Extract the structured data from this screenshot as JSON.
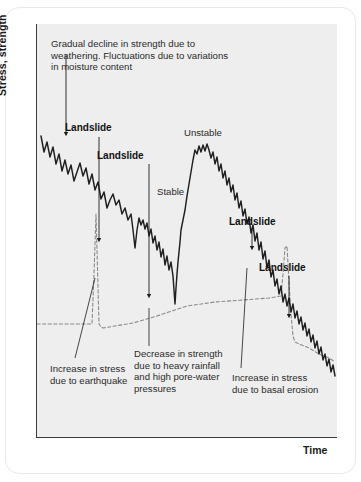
{
  "figure": {
    "axes": {
      "y_label": "Stress, strength",
      "x_label": "Time"
    },
    "annotations": {
      "weathering_note": "Gradual decline in strength due to weathering. Fluctuations due to variations in moisture content",
      "landslide_1": "Landslide",
      "landslide_2": "Landslide",
      "landslide_3": "Landslide",
      "landslide_4": "Landslide",
      "unstable": "Unstable",
      "stable": "Stable",
      "earthquake_note": "Increase in stress due to earthquake",
      "rainfall_note": "Decrease in strength due to heavy rainfall and high pore-water pressures",
      "erosion_note": "Increase in stress due to basal erosion"
    },
    "colors": {
      "plot_background": "#eeeeee",
      "axis": "#3a3a3a",
      "strength_line": "#1f1f1f",
      "stress_line": "#8a8a8a",
      "card_border": "#e9e9e9",
      "text": "#2b2b2b"
    }
  },
  "chart_data": {
    "type": "line",
    "title": "",
    "xlabel": "Time",
    "ylabel": "Stress, strength",
    "grid": false,
    "legend": "none",
    "xlim": [
      0,
      301
    ],
    "ylim": [
      0,
      414
    ],
    "series": [
      {
        "name": "strength",
        "style": "solid",
        "color": "#1f1f1f",
        "description": "Shear strength of the slope: gradual weathering decline with high-frequency moisture fluctuations, punctuated by abrupt landslide drops, a recovery to an unstable peak, then renewed decline.",
        "points": "4,112 7,128 10,118 13,133 16,123 19,140 22,130 25,147 28,136 31,150 34,141 37,157 40,148 43,139 46,152 49,144 52,160 55,150 58,166 61,158 64,175 67,168 70,184 73,176 76,170 79,181 82,176 85,190 88,184 91,196 94,190 96,206 98,224 100,206 102,194 104,201 106,196 108,205 110,199 112,212 114,205 116,219 118,212 120,226 122,218 124,233 126,225 128,241 130,232 132,246 134,238 136,252 137,266 138,280 139,264 140,250 141,238 142,228 143,218 144,206 146,196 148,186 150,172 152,160 154,148 156,136 158,126 160,130 162,122 164,128 166,121 168,127 170,120 172,126 174,134 176,128 178,140 180,133 182,147 184,140 186,154 188,147 190,161 192,154 194,168 196,161 198,176 200,169 202,184 204,177 206,192 208,185 210,200 212,193 214,209 216,201 218,217 220,209 222,226 224,218 226,235 228,227 230,244 232,236 234,253 236,246 238,262 240,255 242,270 244,262 246,278 248,270 250,282 252,274 254,288 256,280 258,294 260,287 262,300 264,293 266,306 268,299 270,312 272,305 274,318 276,311 278,324 280,317 282,330 284,323 286,336 288,330 290,342 292,335 294,348 296,341 298,352"
      },
      {
        "name": "stress",
        "style": "dashed",
        "color": "#8a8a8a",
        "description": "Stress acting on the slope: low and steady, spiking sharply during the earthquake, rising gradually, then stepping up with basal erosion before levelling off.",
        "points": "0,300 52,300 55,300 57,250 59,190 60,226 62,300 64,303 66,304 96,299 120,292 150,282 178,278 206,276 232,274 244,272 246,250 248,224 250,222 252,258 254,290 256,312 258,318 262,320 272,324 282,330 292,334 298,338"
      }
    ],
    "events": [
      {
        "label": "Landslide",
        "x": 63,
        "y_drop_to": 224,
        "cause": "weathering + earthquake"
      },
      {
        "label": "Landslide",
        "x": 112,
        "y_drop_to": 280,
        "cause": "heavy rainfall / pore-water pressure"
      },
      {
        "label": "Landslide",
        "x": 216,
        "y_drop_to": 232,
        "cause": "basal erosion"
      },
      {
        "label": "Landslide",
        "x": 248,
        "y_drop_to": 270,
        "cause": "basal erosion"
      }
    ]
  }
}
